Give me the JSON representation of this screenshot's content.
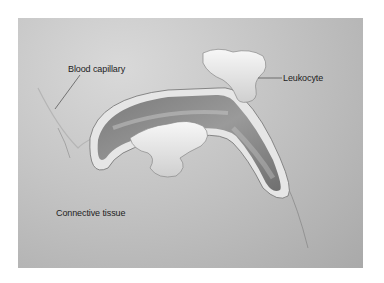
{
  "figure": {
    "labels": {
      "blood_capillary": "Blood capillary",
      "leukocyte": "Leukocyte",
      "connective_tissue": "Connective tissue"
    },
    "colors": {
      "background_light": "#d9d9d9",
      "background_dark": "#a9a9a9",
      "vessel_wall": "#e8e8e8",
      "lumen": "#8e8e8e",
      "cell": "#f0f0f0",
      "label_text": "#222222"
    }
  }
}
